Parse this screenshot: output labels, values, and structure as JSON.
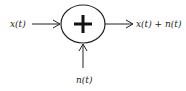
{
  "diagram": {
    "type": "block-diagram",
    "nodes": [
      {
        "id": "sum",
        "shape": "circle",
        "symbol": "+",
        "icon": "plus-icon"
      }
    ],
    "labels": {
      "input": "x(t)",
      "noise": "n(t)",
      "output": "x(t) + n(t)"
    },
    "edges": [
      {
        "from": "input",
        "to": "sum"
      },
      {
        "from": "noise",
        "to": "sum"
      },
      {
        "from": "sum",
        "to": "output"
      }
    ],
    "colors": {
      "stroke": "#222222",
      "background": "#ffffff"
    }
  }
}
